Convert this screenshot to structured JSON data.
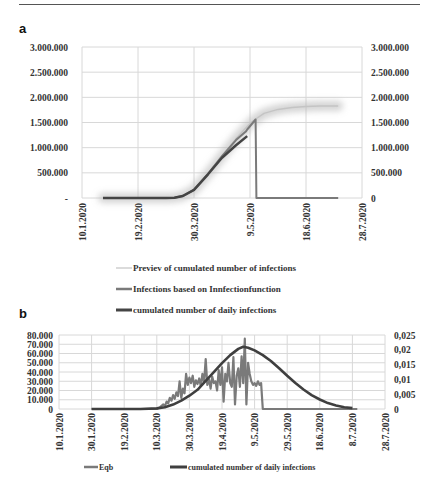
{
  "page": {
    "panel_a_label": "a",
    "panel_b_label": "b"
  },
  "chart_data": [
    {
      "id": "a",
      "type": "line",
      "title": "",
      "xlabel": "",
      "ylabel": "",
      "x_ticks": [
        "10.1.2020",
        "19.2.2020",
        "30.3.2020",
        "9.5.2020",
        "18.6.2020",
        "28.7.2020"
      ],
      "x_tick_days": [
        0,
        40,
        80,
        120,
        160,
        200
      ],
      "x_unit": "days since 10.1.2020",
      "xlim": [
        0,
        200
      ],
      "y_ticks_left": [
        "-",
        "500.000",
        "1.000.000",
        "1.500.000",
        "2.000.000",
        "2.500.000",
        "3.000.000"
      ],
      "y_ticks_right": [
        "0",
        "500.000",
        "1.000.000",
        "1.500.000",
        "2.000.000",
        "2.500.000",
        "3.000.000"
      ],
      "ylim": [
        0,
        3000000
      ],
      "grid": true,
      "legend_position": "bottom",
      "series": [
        {
          "name": "Previev of cumulated number of infections",
          "color": "#bdbdbd",
          "style": "blurred-thick",
          "x": [
            15,
            40,
            60,
            66,
            72,
            80,
            90,
            100,
            110,
            118,
            122,
            130,
            140,
            150,
            160,
            170,
            183
          ],
          "y": [
            0,
            0,
            0,
            5000,
            40000,
            160000,
            480000,
            830000,
            1180000,
            1420000,
            1530000,
            1680000,
            1760000,
            1800000,
            1820000,
            1830000,
            1830000
          ]
        },
        {
          "name": "Infections based on Innfectionfunction",
          "color": "#7a7a7a",
          "style": "medium",
          "x": [
            15,
            40,
            60,
            66,
            72,
            80,
            90,
            100,
            110,
            117,
            118,
            124,
            124.6,
            130,
            160,
            183
          ],
          "y": [
            0,
            0,
            0,
            5000,
            40000,
            160000,
            480000,
            830000,
            1150000,
            1320000,
            1360000,
            1560000,
            0,
            0,
            0,
            0
          ]
        },
        {
          "name": "cumulated number of daily infections",
          "color": "#444444",
          "style": "thick",
          "x": [
            15,
            40,
            60,
            66,
            72,
            80,
            90,
            100,
            110,
            118
          ],
          "y": [
            0,
            0,
            0,
            5000,
            40000,
            160000,
            470000,
            800000,
            1050000,
            1230000
          ]
        }
      ]
    },
    {
      "id": "b",
      "type": "line",
      "title": "",
      "xlabel": "",
      "ylabel": "",
      "x_ticks": [
        "10.1.2020",
        "30.1.2020",
        "19.2.2020",
        "10.3.2020",
        "30.3.2020",
        "19.4.2020",
        "9.5.2020",
        "29.5.2020",
        "18.6.2020",
        "8.7.2020",
        "28.7.2020"
      ],
      "x_tick_days": [
        0,
        20,
        40,
        60,
        80,
        100,
        120,
        140,
        160,
        180,
        200
      ],
      "x_unit": "days since 10.1.2020",
      "xlim": [
        0,
        200
      ],
      "y_ticks_left": [
        "0",
        "10.000",
        "20.000",
        "30.000",
        "40.000",
        "50.000",
        "60.000",
        "70.000",
        "80.000"
      ],
      "ylim_left": [
        0,
        80000
      ],
      "y_ticks_right": [
        "0",
        "0,005",
        "0,01",
        "0,015",
        "0,02",
        "0,025"
      ],
      "ylim_right": [
        0,
        0.025
      ],
      "grid": true,
      "legend_position": "bottom",
      "series": [
        {
          "name": "Eqb",
          "axis": "left",
          "color": "#7a7a7a",
          "x": [
            20,
            60,
            62,
            64,
            65,
            66,
            67,
            68,
            69,
            70,
            71,
            72,
            73,
            74,
            75,
            76,
            77,
            78,
            79,
            80,
            81,
            82,
            83,
            84,
            85,
            86,
            87,
            88,
            89,
            90,
            91,
            92,
            93,
            94,
            95,
            96,
            97,
            98,
            99,
            100,
            101,
            102,
            103,
            104,
            105,
            106,
            107,
            108,
            109,
            110,
            111,
            112,
            113,
            114,
            115,
            116,
            117,
            118,
            119,
            120,
            121,
            122,
            123,
            124,
            125,
            126,
            127,
            183
          ],
          "y": [
            0,
            0,
            2000,
            5000,
            3000,
            8000,
            6000,
            12000,
            9000,
            15000,
            11000,
            18000,
            14000,
            30000,
            12000,
            22000,
            17000,
            38000,
            26000,
            34000,
            28000,
            36000,
            24000,
            31000,
            27000,
            33000,
            25000,
            38000,
            29000,
            54000,
            26000,
            32000,
            22000,
            35000,
            28000,
            30000,
            20000,
            42000,
            26000,
            45000,
            8000,
            38000,
            30000,
            50000,
            28000,
            24000,
            56000,
            5000,
            36000,
            44000,
            24000,
            57000,
            28000,
            76000,
            5000,
            50000,
            38000,
            30000,
            26000,
            28000,
            25000,
            30000,
            26000,
            28000,
            0,
            0,
            0,
            0
          ]
        },
        {
          "name": "cumulated number of daily infections",
          "axis": "right",
          "color": "#3f3f3f",
          "x": [
            20,
            50,
            60,
            65,
            70,
            75,
            80,
            85,
            90,
            95,
            100,
            105,
            110,
            113,
            116,
            120,
            125,
            130,
            135,
            140,
            145,
            150,
            155,
            160,
            165,
            170,
            175,
            180
          ],
          "y": [
            0,
            0,
            0.0002,
            0.0006,
            0.0015,
            0.0028,
            0.0045,
            0.0065,
            0.0095,
            0.0125,
            0.0155,
            0.0182,
            0.0203,
            0.021,
            0.0207,
            0.0198,
            0.0182,
            0.0162,
            0.0138,
            0.0112,
            0.0088,
            0.0066,
            0.0047,
            0.0032,
            0.002,
            0.0012,
            0.0006,
            0.0003
          ]
        }
      ]
    }
  ]
}
